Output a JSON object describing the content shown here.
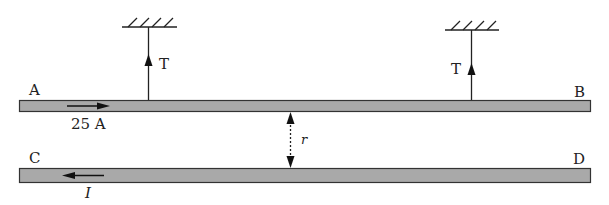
{
  "diagram": {
    "wires": [
      {
        "id": "AB",
        "start_label": "A",
        "end_label": "B",
        "current_label": "25 A",
        "current_direction": "right"
      },
      {
        "id": "CD",
        "start_label": "C",
        "end_label": "D",
        "current_label": "I",
        "current_direction": "left"
      }
    ],
    "supports": [
      {
        "id": "left",
        "tension_label": "T"
      },
      {
        "id": "right",
        "tension_label": "T"
      }
    ],
    "separation_label": "r",
    "colors": {
      "wire_fill": "#a9a9a9",
      "wire_stroke": "#333333",
      "line": "#222222"
    }
  }
}
